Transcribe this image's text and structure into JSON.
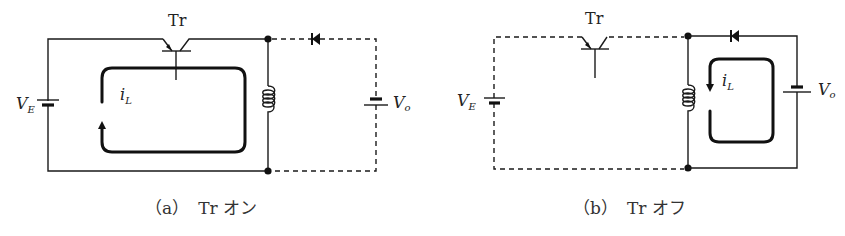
{
  "colors": {
    "line": "#1a1a1a",
    "background": "#ffffff"
  },
  "panels": [
    {
      "id": "a",
      "transistor_label": "Tr",
      "source_label_main": "V",
      "source_label_sub": "E",
      "output_label_main": "V",
      "output_label_sub": "o",
      "current_label_main": "i",
      "current_label_sub": "L",
      "caption": "（a）　Tr オン",
      "state": "transistor on: current flows through VE, Tr and inductor; diode and Vo branch dashed (inactive)"
    },
    {
      "id": "b",
      "transistor_label": "Tr",
      "source_label_main": "V",
      "source_label_sub": "E",
      "output_label_main": "V",
      "output_label_sub": "o",
      "current_label_main": "i",
      "current_label_sub": "L",
      "caption": "（b）　Tr オフ",
      "state": "transistor off: VE and Tr branch dashed (inactive); inductor current flows through diode and Vo"
    }
  ]
}
